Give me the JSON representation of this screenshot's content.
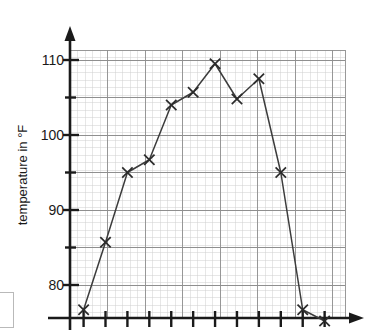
{
  "chart_data": {
    "type": "line",
    "title": "",
    "subtitle": "",
    "xlabel": "",
    "ylabel": "temperature in °F",
    "ylim": [
      74,
      112
    ],
    "xlim": [
      0,
      13
    ],
    "grid": true,
    "legend": false,
    "legend_position": "none",
    "marker": "x",
    "y_tick_labels": [
      "110",
      "100",
      "90",
      "80"
    ],
    "y_ticks_major": [
      110,
      100,
      90,
      80
    ],
    "y_ticks_minor": [
      105,
      95,
      85
    ],
    "x_ticks_count": 12,
    "x_tick_labels": [],
    "x": [
      1,
      2,
      3,
      4,
      5,
      6,
      7,
      8,
      9,
      10,
      11,
      12
    ],
    "values": [
      76.7,
      85.7,
      95.0,
      96.7,
      104.0,
      105.7,
      109.5,
      104.8,
      107.5,
      95.0,
      76.7,
      75.2
    ],
    "series": [
      {
        "name": "temperature",
        "values": [
          76.7,
          85.7,
          95.0,
          96.7,
          104.0,
          105.7,
          109.5,
          104.8,
          107.5,
          95.0,
          76.7,
          75.2
        ]
      }
    ],
    "annotations": []
  },
  "axis": {
    "y_label": "temperature in °F",
    "y_tick_110": "110",
    "y_tick_100": "100",
    "y_tick_90": "90",
    "y_tick_80": "80"
  },
  "colors": {
    "line": "#3c3c3c",
    "marker": "#2b2b2b",
    "axis": "#1a1a1a",
    "grid_minor": "#c9c9c9",
    "grid_major": "#9a9a9a",
    "background": "#ffffff"
  }
}
